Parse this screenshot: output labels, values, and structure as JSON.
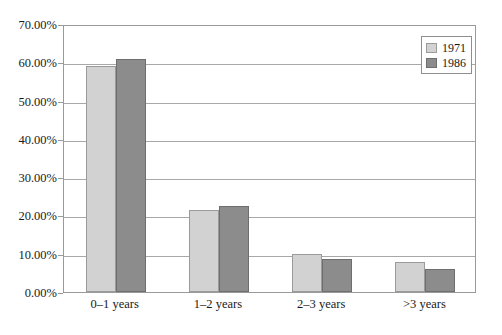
{
  "chart_data": {
    "type": "bar",
    "title": "",
    "subtitle": "",
    "xlabel": "",
    "ylabel": "",
    "categories": [
      "0–1 years",
      "1–2 years",
      "2–3 years",
      ">3 years"
    ],
    "series": [
      {
        "name": "1971",
        "color": "#d2d2d2",
        "values": [
          58.9,
          21.5,
          9.9,
          7.8
        ]
      },
      {
        "name": "1986",
        "color": "#8c8c8c",
        "values": [
          60.8,
          22.5,
          8.6,
          6.0
        ]
      }
    ],
    "ylim": [
      0,
      70
    ],
    "ytick_values": [
      0,
      10,
      20,
      30,
      40,
      50,
      60,
      70
    ],
    "ytick_labels": [
      "0.00%",
      "10.00%",
      "20.00%",
      "30.00%",
      "40.00%",
      "50.00%",
      "60.00%",
      "70.00%"
    ],
    "grid": true,
    "grid_axis": "y",
    "legend_position": "top-right",
    "legend_entries": [
      "1971",
      "1986"
    ],
    "value_format": "percent",
    "plot_background": "#ffffff",
    "axis_color": "#9a9a9a",
    "gridline_color": "#a8a8a8"
  }
}
